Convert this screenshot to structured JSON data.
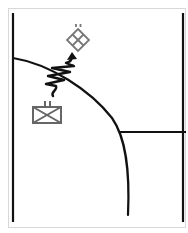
{
  "diagram": {
    "title": "",
    "colors": {
      "background": "#ffffff",
      "frame_border": "#d8d8d8",
      "line": "#111111",
      "symbol": "#666666"
    },
    "boundaries": [
      {
        "id": "left-boundary",
        "x1": 13,
        "y1": 13,
        "x2": 13,
        "y2": 222
      },
      {
        "id": "right-boundary",
        "x1": 183,
        "y1": 13,
        "x2": 183,
        "y2": 222
      },
      {
        "id": "lateral-boundary",
        "x1": 120,
        "y1": 132,
        "x2": 186,
        "y2": 132
      }
    ],
    "curve": {
      "id": "phase-line",
      "path": "M13,58 C50,64 90,90 112,118 C126,138 130,170 128,215"
    },
    "symbols": [
      {
        "id": "friendly-unit",
        "type": "unit-box-x",
        "echelon_ticks": 2,
        "x": 33,
        "y": 107,
        "w": 28,
        "h": 16
      },
      {
        "id": "objective-diamond",
        "type": "quartered-diamond",
        "echelon_ticks": 2,
        "cx": 78,
        "cy": 40,
        "r": 11
      },
      {
        "id": "attack-arrow",
        "type": "wavy-penetration-arrow",
        "from": [
          53,
          96
        ],
        "to": [
          72,
          55
        ]
      }
    ]
  }
}
